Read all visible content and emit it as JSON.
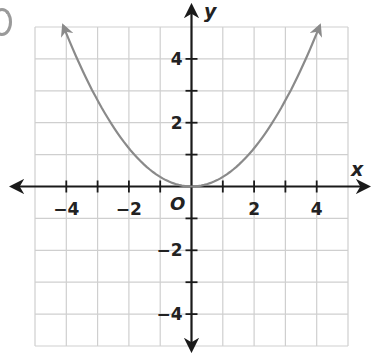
{
  "chart_data": {
    "type": "line",
    "title": "",
    "xlabel": "x",
    "ylabel": "y",
    "origin_label": "O",
    "xlim": [
      -5,
      5
    ],
    "ylim": [
      -5,
      5
    ],
    "grid": true,
    "x_ticks": [
      -4,
      -2,
      2,
      4
    ],
    "y_ticks": [
      4,
      2,
      -2,
      -4
    ],
    "x_tick_labels": [
      "−4",
      "−2",
      "2",
      "4"
    ],
    "y_tick_labels": [
      "4",
      "2",
      "−2",
      "−4"
    ],
    "series": [
      {
        "name": "parabola",
        "equation": "y = 0.3x^2",
        "x": [
          -4.1,
          -4,
          -3,
          -2,
          -1,
          0,
          1,
          2,
          3,
          4,
          4.1
        ],
        "values": [
          5.04,
          4.8,
          2.7,
          1.2,
          0.3,
          0,
          0.3,
          1.2,
          2.7,
          4.8,
          5.04
        ],
        "color": "#8a8a8a",
        "arrows_at_ends": true
      }
    ]
  },
  "colors": {
    "grid": "#cfcfcf",
    "axis": "#1a1a1a",
    "curve": "#8a8a8a"
  }
}
